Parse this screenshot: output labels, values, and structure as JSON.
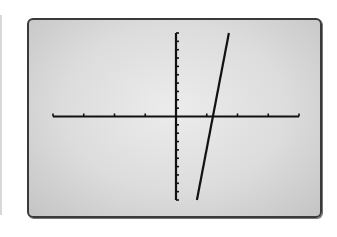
{
  "screen": {
    "colors": {
      "background": "#dcdcdc",
      "frame": "#3a3a3a",
      "ink": "#111111"
    }
  },
  "chart_data": {
    "type": "line",
    "title": "",
    "xlabel": "",
    "ylabel": "",
    "window": {
      "xmin": -4,
      "xmax": 4,
      "xscl": 1,
      "ymin": -10,
      "ymax": 10,
      "yscl": 1
    },
    "xlim": [
      -4,
      4
    ],
    "ylim": [
      -10,
      10
    ],
    "grid": false,
    "legend": null,
    "series": [
      {
        "name": "linear function",
        "x": [
          0.68,
          1.2,
          1.72
        ],
        "y": [
          -10,
          0,
          10
        ],
        "slope_estimate": 19.2,
        "x_intercept_estimate": 1.2
      }
    ],
    "x_ticks": [
      -4,
      -3,
      -2,
      -1,
      1,
      2,
      3,
      4
    ],
    "y_ticks": [
      -10,
      -9,
      -8,
      -7,
      -6,
      -5,
      -4,
      -3,
      -2,
      -1,
      1,
      2,
      3,
      4,
      5,
      6,
      7,
      8,
      9,
      10
    ]
  }
}
